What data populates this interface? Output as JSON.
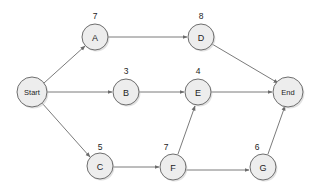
{
  "diagram": {
    "type": "activity-on-node-network",
    "title": "",
    "background_color": "#ffffff",
    "node_fill_color": "#ededed",
    "node_stroke_color": "#6e6e6e",
    "edge_color": "#7b7b7b",
    "text_color": "#1d1d1d",
    "nodes": [
      {
        "id": "start",
        "label": "Start",
        "duration": "",
        "cx": 32,
        "cy": 92,
        "r": 15,
        "label_size": "small",
        "dur_x": 0,
        "dur_y": 0
      },
      {
        "id": "a",
        "label": "A",
        "duration": "7",
        "cx": 95,
        "cy": 37,
        "r": 13,
        "label_size": "normal",
        "dur_x": 95,
        "dur_y": 16
      },
      {
        "id": "d",
        "label": "D",
        "duration": "8",
        "cx": 201,
        "cy": 37,
        "r": 13,
        "label_size": "normal",
        "dur_x": 201,
        "dur_y": 16
      },
      {
        "id": "b",
        "label": "B",
        "duration": "3",
        "cx": 126,
        "cy": 92,
        "r": 13,
        "label_size": "normal",
        "dur_x": 126,
        "dur_y": 71
      },
      {
        "id": "e",
        "label": "E",
        "duration": "4",
        "cx": 198,
        "cy": 92,
        "r": 13,
        "label_size": "normal",
        "dur_x": 198,
        "dur_y": 71
      },
      {
        "id": "end",
        "label": "End",
        "duration": "",
        "cx": 288,
        "cy": 92,
        "r": 15,
        "label_size": "small",
        "dur_x": 0,
        "dur_y": 0
      },
      {
        "id": "c",
        "label": "C",
        "duration": "5",
        "cx": 100,
        "cy": 166,
        "r": 13,
        "label_size": "normal",
        "dur_x": 100,
        "dur_y": 147
      },
      {
        "id": "f",
        "label": "F",
        "duration": "7",
        "cx": 173,
        "cy": 167,
        "r": 13,
        "label_size": "normal",
        "dur_x": 166,
        "dur_y": 147
      },
      {
        "id": "g",
        "label": "G",
        "duration": "6",
        "cx": 263,
        "cy": 167,
        "r": 13,
        "label_size": "normal",
        "dur_x": 257,
        "dur_y": 147
      }
    ],
    "edges": [
      {
        "id": "start-a",
        "from": "Start",
        "to": "A",
        "x1": 44,
        "y1": 83,
        "x2": 85,
        "y2": 46
      },
      {
        "id": "start-b",
        "from": "Start",
        "to": "B",
        "x1": 47,
        "y1": 92,
        "x2": 112,
        "y2": 92
      },
      {
        "id": "start-c",
        "from": "Start",
        "to": "C",
        "x1": 42,
        "y1": 103,
        "x2": 90,
        "y2": 157
      },
      {
        "id": "a-d",
        "from": "A",
        "to": "D",
        "x1": 108,
        "y1": 37,
        "x2": 187,
        "y2": 37
      },
      {
        "id": "d-end",
        "from": "D",
        "to": "End",
        "x1": 212,
        "y1": 44,
        "x2": 278,
        "y2": 83
      },
      {
        "id": "b-e",
        "from": "B",
        "to": "E",
        "x1": 139,
        "y1": 92,
        "x2": 184,
        "y2": 92
      },
      {
        "id": "e-end",
        "from": "E",
        "to": "End",
        "x1": 211,
        "y1": 92,
        "x2": 272,
        "y2": 92
      },
      {
        "id": "c-f",
        "from": "C",
        "to": "F",
        "x1": 113,
        "y1": 167,
        "x2": 159,
        "y2": 167
      },
      {
        "id": "f-e",
        "from": "F",
        "to": "E",
        "x1": 178,
        "y1": 154,
        "x2": 195,
        "y2": 106
      },
      {
        "id": "f-g",
        "from": "F",
        "to": "G",
        "x1": 186,
        "y1": 170,
        "x2": 249,
        "y2": 170
      },
      {
        "id": "g-end",
        "from": "G",
        "to": "End",
        "x1": 268,
        "y1": 154,
        "x2": 285,
        "y2": 106
      }
    ]
  }
}
